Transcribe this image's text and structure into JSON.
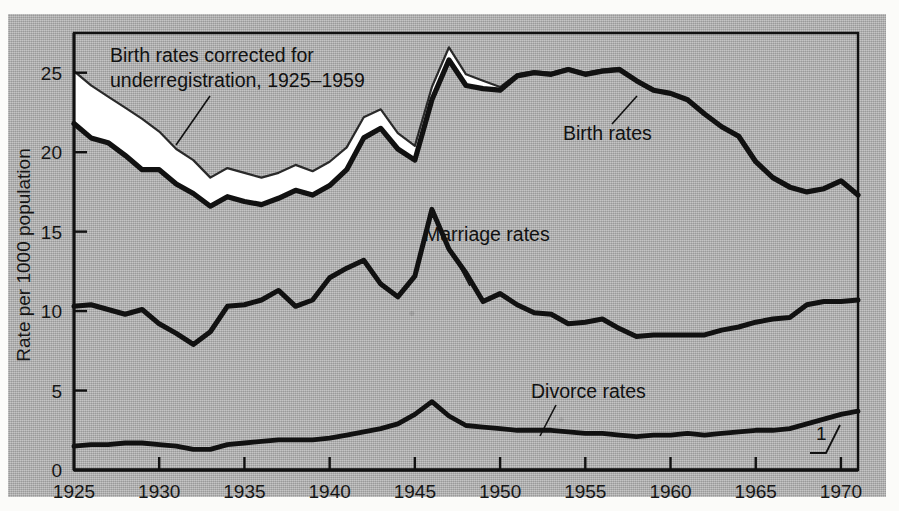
{
  "figure": {
    "y_axis_title": "Rate per 1000 population",
    "footnote_marker": "1",
    "annotations": {
      "corrected_line1": "Birth rates corrected for",
      "corrected_line2": "underregistration, 1925–1959",
      "birth": "Birth rates",
      "marriage": "Marriage rates",
      "divorce": "Divorce rates"
    },
    "colors": {
      "plate": "#b0b0b0",
      "ink": "#111111",
      "band": "#ffffff"
    }
  },
  "chart_data": {
    "type": "line",
    "title": "",
    "xlabel": "",
    "ylabel": "Rate per 1000 population",
    "xlim": [
      1925,
      1971
    ],
    "ylim": [
      0,
      27.5
    ],
    "yticks": [
      0,
      5,
      10,
      15,
      20,
      25
    ],
    "xticks": [
      1925,
      1930,
      1935,
      1940,
      1945,
      1950,
      1955,
      1960,
      1965,
      1970
    ],
    "xticklabels": [
      "1925",
      "1930",
      "1935",
      "1940",
      "1945",
      "1950",
      "1955",
      "1960",
      "1965",
      "1970"
    ],
    "yticklabels": [
      "0",
      "5",
      "10",
      "15",
      "20",
      "25"
    ],
    "grid": false,
    "legend": "inline-annotations",
    "x": [
      1925,
      1926,
      1927,
      1928,
      1929,
      1930,
      1931,
      1932,
      1933,
      1934,
      1935,
      1936,
      1937,
      1938,
      1939,
      1940,
      1941,
      1942,
      1943,
      1944,
      1945,
      1946,
      1947,
      1948,
      1949,
      1950,
      1951,
      1952,
      1953,
      1954,
      1955,
      1956,
      1957,
      1958,
      1959,
      1960,
      1961,
      1962,
      1963,
      1964,
      1965,
      1966,
      1967,
      1968,
      1969,
      1970,
      1971
    ],
    "series": [
      {
        "name": "Birth rates corrected for underregistration, 1925–1959",
        "annotation": "Birth rates corrected for underregistration, 1925–1959",
        "style": "white-band-upper",
        "x": [
          1925,
          1926,
          1927,
          1928,
          1929,
          1930,
          1931,
          1932,
          1933,
          1934,
          1935,
          1936,
          1937,
          1938,
          1939,
          1940,
          1941,
          1942,
          1943,
          1944,
          1945,
          1946,
          1947,
          1948,
          1949,
          1950,
          1951,
          1952,
          1953,
          1954,
          1955,
          1956,
          1957,
          1958,
          1959
        ],
        "values": [
          25.1,
          24.2,
          23.5,
          22.8,
          22.1,
          21.3,
          20.2,
          19.5,
          18.4,
          19.0,
          18.7,
          18.4,
          18.7,
          19.2,
          18.8,
          19.4,
          20.3,
          22.2,
          22.7,
          21.2,
          20.4,
          24.1,
          26.6,
          24.9,
          24.5,
          24.1,
          24.9,
          25.1,
          25.0,
          25.3,
          25.0,
          25.2,
          25.3,
          24.5,
          24.0
        ]
      },
      {
        "name": "Birth rates",
        "annotation": "Birth rates",
        "style": "heavy-black",
        "values": [
          21.8,
          20.9,
          20.6,
          19.8,
          18.9,
          18.9,
          18.0,
          17.4,
          16.6,
          17.2,
          16.9,
          16.7,
          17.1,
          17.6,
          17.3,
          17.9,
          18.9,
          20.9,
          21.5,
          20.2,
          19.5,
          23.3,
          25.8,
          24.2,
          24.0,
          23.9,
          24.8,
          25.0,
          24.9,
          25.2,
          24.9,
          25.1,
          25.2,
          24.5,
          23.9,
          23.7,
          23.3,
          22.4,
          21.6,
          21.0,
          19.4,
          18.4,
          17.8,
          17.5,
          17.7,
          18.2,
          17.3
        ]
      },
      {
        "name": "Marriage rates",
        "annotation": "Marriage rates",
        "style": "heavy-black",
        "values": [
          10.3,
          10.4,
          10.1,
          9.8,
          10.1,
          9.2,
          8.6,
          7.9,
          8.7,
          10.3,
          10.4,
          10.7,
          11.3,
          10.3,
          10.7,
          12.1,
          12.7,
          13.2,
          11.7,
          10.9,
          12.2,
          16.4,
          13.9,
          12.4,
          10.6,
          11.1,
          10.4,
          9.9,
          9.8,
          9.2,
          9.3,
          9.5,
          8.9,
          8.4,
          8.5,
          8.5,
          8.5,
          8.5,
          8.8,
          9.0,
          9.3,
          9.5,
          9.6,
          10.4,
          10.6,
          10.6,
          10.7
        ]
      },
      {
        "name": "Divorce rates",
        "annotation": "Divorce rates",
        "style": "heavy-black",
        "values": [
          1.5,
          1.6,
          1.6,
          1.7,
          1.7,
          1.6,
          1.5,
          1.3,
          1.3,
          1.6,
          1.7,
          1.8,
          1.9,
          1.9,
          1.9,
          2.0,
          2.2,
          2.4,
          2.6,
          2.9,
          3.5,
          4.3,
          3.4,
          2.8,
          2.7,
          2.6,
          2.5,
          2.5,
          2.5,
          2.4,
          2.3,
          2.3,
          2.2,
          2.1,
          2.2,
          2.2,
          2.3,
          2.2,
          2.3,
          2.4,
          2.5,
          2.5,
          2.6,
          2.9,
          3.2,
          3.5,
          3.7
        ]
      }
    ]
  }
}
